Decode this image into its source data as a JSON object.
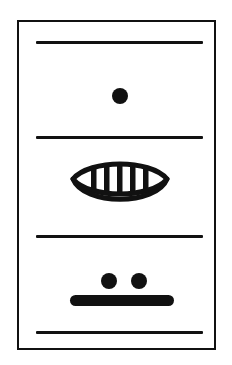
{
  "panel": {
    "title": "Pictographic Panel",
    "background_color": "#ffffff",
    "ink_color": "#111111",
    "frame": {
      "label": "Outer rectangular frame",
      "x": 17,
      "y": 20,
      "width": 199,
      "height": 330,
      "stroke_width": 2.5
    },
    "dividers": [
      {
        "label": "Divider rule 1",
        "x": 36,
        "y": 41,
        "width": 167,
        "thickness": 3
      },
      {
        "label": "Divider rule 2",
        "x": 36,
        "y": 136,
        "width": 167,
        "thickness": 3
      },
      {
        "label": "Divider rule 3",
        "x": 36,
        "y": 235,
        "width": 167,
        "thickness": 3
      },
      {
        "label": "Divider rule 4",
        "x": 36,
        "y": 331,
        "width": 167,
        "thickness": 3
      }
    ],
    "registers": [
      {
        "name": "register-one",
        "label": "Single dot register",
        "glyphs": [
          {
            "type": "dot",
            "label": "Single dot",
            "cx": 118,
            "cy": 88,
            "radius": 8
          }
        ]
      },
      {
        "name": "register-two",
        "label": "Striped eye register",
        "glyphs": [
          {
            "type": "eye",
            "label": "Striped eye / vesica glyph",
            "x": 66,
            "y": 150,
            "width": 104,
            "height": 62,
            "stripe_count": 6,
            "stroke_width": 5
          }
        ]
      },
      {
        "name": "register-three",
        "label": "Two dots and bar register",
        "glyphs": [
          {
            "type": "dot",
            "label": "Left dot",
            "cx": 107,
            "cy": 271,
            "radius": 8
          },
          {
            "type": "dot",
            "label": "Right dot",
            "cx": 137,
            "cy": 271,
            "radius": 8
          },
          {
            "type": "bar",
            "label": "Thick rounded bar",
            "x": 70,
            "y": 293,
            "width": 104,
            "height": 11
          }
        ]
      }
    ]
  }
}
